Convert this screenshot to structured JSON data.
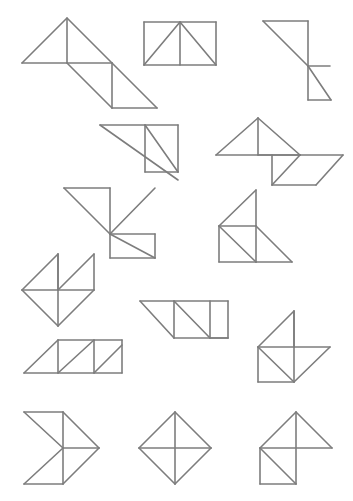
{
  "page": {
    "width": 353,
    "height": 501,
    "background_color": "#ffffff",
    "stroke_color": "#7d7d7d",
    "stroke_width": 1.6,
    "figure_count": 15
  },
  "figures": [
    {
      "id": "figure-1",
      "name": "triangle-with-trailing-parallelogram",
      "row": 1,
      "column": 1,
      "segments": [
        [
          [
            22,
            63
          ],
          [
            67,
            18
          ],
          [
            112,
            63
          ]
        ],
        [
          [
            22,
            63
          ],
          [
            112,
            63
          ]
        ],
        [
          [
            67,
            18
          ],
          [
            67,
            63
          ]
        ],
        [
          [
            67,
            63
          ],
          [
            112,
            108
          ]
        ],
        [
          [
            112,
            63
          ],
          [
            112,
            108
          ]
        ],
        [
          [
            112,
            63
          ],
          [
            157,
            108
          ]
        ],
        [
          [
            112,
            108
          ],
          [
            157,
            108
          ]
        ]
      ]
    },
    {
      "id": "figure-2",
      "name": "rectangle-with-inscribed-triangle",
      "row": 1,
      "column": 2,
      "segments": [
        [
          [
            144,
            22
          ],
          [
            216,
            22
          ]
        ],
        [
          [
            216,
            22
          ],
          [
            216,
            65
          ]
        ],
        [
          [
            216,
            65
          ],
          [
            144,
            65
          ]
        ],
        [
          [
            144,
            65
          ],
          [
            144,
            22
          ]
        ],
        [
          [
            144,
            65
          ],
          [
            180,
            22
          ]
        ],
        [
          [
            180,
            22
          ],
          [
            216,
            65
          ]
        ],
        [
          [
            180,
            22
          ],
          [
            180,
            65
          ]
        ]
      ]
    },
    {
      "id": "figure-3",
      "name": "stacked-z-triangles",
      "row": 1,
      "column": 3,
      "segments": [
        [
          [
            263,
            21
          ],
          [
            308,
            21
          ]
        ],
        [
          [
            263,
            21
          ],
          [
            308,
            66
          ]
        ],
        [
          [
            308,
            21
          ],
          [
            308,
            66
          ]
        ],
        [
          [
            308,
            66
          ],
          [
            330,
            66
          ]
        ],
        [
          [
            308,
            66
          ],
          [
            308,
            100
          ]
        ],
        [
          [
            308,
            66
          ],
          [
            331,
            100
          ]
        ],
        [
          [
            308,
            100
          ],
          [
            331,
            100
          ]
        ]
      ]
    },
    {
      "id": "figure-4",
      "name": "large-triangle-with-square-diagonal",
      "row": 2,
      "column": 1,
      "segments": [
        [
          [
            100,
            125
          ],
          [
            178,
            125
          ]
        ],
        [
          [
            100,
            125
          ],
          [
            178,
            180
          ]
        ],
        [
          [
            145,
            125
          ],
          [
            145,
            172
          ]
        ],
        [
          [
            145,
            172
          ],
          [
            178,
            172
          ]
        ],
        [
          [
            178,
            125
          ],
          [
            178,
            172
          ]
        ],
        [
          [
            145,
            125
          ],
          [
            178,
            172
          ]
        ]
      ]
    },
    {
      "id": "figure-5",
      "name": "triangle-with-adjacent-diamond",
      "row": 2,
      "column": 2,
      "segments": [
        [
          [
            216,
            155
          ],
          [
            258,
            118
          ]
        ],
        [
          [
            258,
            118
          ],
          [
            300,
            155
          ]
        ],
        [
          [
            216,
            155
          ],
          [
            300,
            155
          ]
        ],
        [
          [
            258,
            118
          ],
          [
            258,
            155
          ]
        ],
        [
          [
            258,
            155
          ],
          [
            300,
            155
          ]
        ],
        [
          [
            300,
            155
          ],
          [
            343,
            155
          ]
        ],
        [
          [
            300,
            155
          ],
          [
            272,
            185
          ]
        ],
        [
          [
            272,
            185
          ],
          [
            316,
            185
          ]
        ],
        [
          [
            272,
            185
          ],
          [
            272,
            155
          ]
        ],
        [
          [
            316,
            185
          ],
          [
            343,
            155
          ]
        ]
      ]
    },
    {
      "id": "figure-6",
      "name": "stepped-parallelogram-stack",
      "row": 3,
      "column": 1,
      "segments": [
        [
          [
            64,
            188
          ],
          [
            110,
            188
          ]
        ],
        [
          [
            64,
            188
          ],
          [
            110,
            234
          ]
        ],
        [
          [
            110,
            188
          ],
          [
            110,
            234
          ]
        ],
        [
          [
            110,
            234
          ],
          [
            155,
            188
          ]
        ],
        [
          [
            110,
            234
          ],
          [
            155,
            234
          ]
        ],
        [
          [
            110,
            234
          ],
          [
            155,
            258
          ]
        ],
        [
          [
            155,
            234
          ],
          [
            155,
            258
          ]
        ],
        [
          [
            110,
            258
          ],
          [
            155,
            258
          ]
        ],
        [
          [
            110,
            234
          ],
          [
            110,
            258
          ]
        ]
      ]
    },
    {
      "id": "figure-7",
      "name": "triangle-square-triangle-cluster",
      "row": 3,
      "column": 2,
      "segments": [
        [
          [
            219,
            226
          ],
          [
            256,
            190
          ]
        ],
        [
          [
            256,
            190
          ],
          [
            256,
            226
          ]
        ],
        [
          [
            219,
            226
          ],
          [
            256,
            226
          ]
        ],
        [
          [
            219,
            226
          ],
          [
            219,
            262
          ]
        ],
        [
          [
            219,
            262
          ],
          [
            256,
            262
          ]
        ],
        [
          [
            256,
            226
          ],
          [
            256,
            262
          ]
        ],
        [
          [
            219,
            226
          ],
          [
            256,
            262
          ]
        ],
        [
          [
            256,
            226
          ],
          [
            292,
            262
          ]
        ],
        [
          [
            256,
            262
          ],
          [
            292,
            262
          ]
        ]
      ]
    },
    {
      "id": "figure-8",
      "name": "pinwheel-quad-triangles",
      "row": 4,
      "column": 1,
      "segments": [
        [
          [
            22,
            290
          ],
          [
            58,
            254
          ]
        ],
        [
          [
            58,
            254
          ],
          [
            58,
            290
          ]
        ],
        [
          [
            22,
            290
          ],
          [
            58,
            290
          ]
        ],
        [
          [
            58,
            290
          ],
          [
            94,
            254
          ]
        ],
        [
          [
            58,
            254
          ],
          [
            58,
            326
          ]
        ],
        [
          [
            22,
            290
          ],
          [
            58,
            326
          ]
        ],
        [
          [
            58,
            326
          ],
          [
            94,
            290
          ]
        ],
        [
          [
            58,
            290
          ],
          [
            94,
            290
          ]
        ],
        [
          [
            94,
            254
          ],
          [
            94,
            290
          ]
        ]
      ]
    },
    {
      "id": "figure-9",
      "name": "inverted-trapezoid-with-triangles",
      "row": 4,
      "column": 2,
      "segments": [
        [
          [
            140,
            301
          ],
          [
            228,
            301
          ]
        ],
        [
          [
            140,
            301
          ],
          [
            174,
            338
          ]
        ],
        [
          [
            174,
            338
          ],
          [
            228,
            338
          ]
        ],
        [
          [
            228,
            338
          ],
          [
            228,
            301
          ]
        ],
        [
          [
            174,
            301
          ],
          [
            174,
            338
          ]
        ],
        [
          [
            174,
            301
          ],
          [
            210,
            338
          ]
        ],
        [
          [
            210,
            301
          ],
          [
            210,
            338
          ]
        ],
        [
          [
            210,
            338
          ],
          [
            228,
            338
          ]
        ]
      ]
    },
    {
      "id": "figure-10",
      "name": "pinwheel-with-corner-square",
      "row": 4,
      "column": 3,
      "segments": [
        [
          [
            258,
            347
          ],
          [
            294,
            311
          ]
        ],
        [
          [
            294,
            311
          ],
          [
            294,
            347
          ]
        ],
        [
          [
            258,
            347
          ],
          [
            294,
            347
          ]
        ],
        [
          [
            294,
            347
          ],
          [
            330,
            347
          ]
        ],
        [
          [
            294,
            311
          ],
          [
            294,
            382
          ]
        ],
        [
          [
            258,
            347
          ],
          [
            294,
            382
          ]
        ],
        [
          [
            294,
            382
          ],
          [
            330,
            347
          ]
        ],
        [
          [
            258,
            347
          ],
          [
            258,
            382
          ]
        ],
        [
          [
            258,
            382
          ],
          [
            294,
            382
          ]
        ]
      ]
    },
    {
      "id": "figure-11",
      "name": "trapezoid-with-internal-triangles",
      "row": 5,
      "column": 1,
      "segments": [
        [
          [
            24,
            373
          ],
          [
            122,
            373
          ]
        ],
        [
          [
            24,
            373
          ],
          [
            58,
            340
          ]
        ],
        [
          [
            58,
            340
          ],
          [
            122,
            340
          ]
        ],
        [
          [
            122,
            340
          ],
          [
            122,
            373
          ]
        ],
        [
          [
            58,
            340
          ],
          [
            58,
            373
          ]
        ],
        [
          [
            58,
            373
          ],
          [
            94,
            340
          ]
        ],
        [
          [
            94,
            340
          ],
          [
            94,
            373
          ]
        ],
        [
          [
            94,
            373
          ],
          [
            122,
            345
          ]
        ]
      ]
    },
    {
      "id": "figure-12",
      "name": "right-pointing-chevron-arrow",
      "row": 6,
      "column": 1,
      "segments": [
        [
          [
            24,
            412
          ],
          [
            63,
            412
          ]
        ],
        [
          [
            24,
            412
          ],
          [
            63,
            448
          ]
        ],
        [
          [
            63,
            448
          ],
          [
            24,
            484
          ]
        ],
        [
          [
            24,
            484
          ],
          [
            63,
            484
          ]
        ],
        [
          [
            63,
            412
          ],
          [
            63,
            484
          ]
        ],
        [
          [
            63,
            412
          ],
          [
            99,
            448
          ]
        ],
        [
          [
            63,
            448
          ],
          [
            99,
            448
          ]
        ],
        [
          [
            63,
            484
          ],
          [
            99,
            448
          ]
        ]
      ]
    },
    {
      "id": "figure-13",
      "name": "diamond-with-cross-lines",
      "row": 6,
      "column": 2,
      "segments": [
        [
          [
            139,
            448
          ],
          [
            175,
            412
          ]
        ],
        [
          [
            175,
            412
          ],
          [
            211,
            448
          ]
        ],
        [
          [
            211,
            448
          ],
          [
            175,
            484
          ]
        ],
        [
          [
            175,
            484
          ],
          [
            139,
            448
          ]
        ],
        [
          [
            139,
            448
          ],
          [
            211,
            448
          ]
        ],
        [
          [
            175,
            412
          ],
          [
            175,
            484
          ]
        ]
      ]
    },
    {
      "id": "figure-14",
      "name": "triangle-over-square-pinwheel",
      "row": 6,
      "column": 3,
      "segments": [
        [
          [
            260,
            448
          ],
          [
            296,
            412
          ]
        ],
        [
          [
            296,
            412
          ],
          [
            332,
            448
          ]
        ],
        [
          [
            260,
            448
          ],
          [
            332,
            448
          ]
        ],
        [
          [
            296,
            412
          ],
          [
            296,
            484
          ]
        ],
        [
          [
            260,
            448
          ],
          [
            260,
            484
          ]
        ],
        [
          [
            260,
            484
          ],
          [
            296,
            484
          ]
        ],
        [
          [
            260,
            448
          ],
          [
            296,
            484
          ]
        ]
      ]
    },
    {
      "id": "figure-15",
      "name": "small-tail-triangle",
      "row": 3,
      "column": 3,
      "segments": []
    }
  ]
}
